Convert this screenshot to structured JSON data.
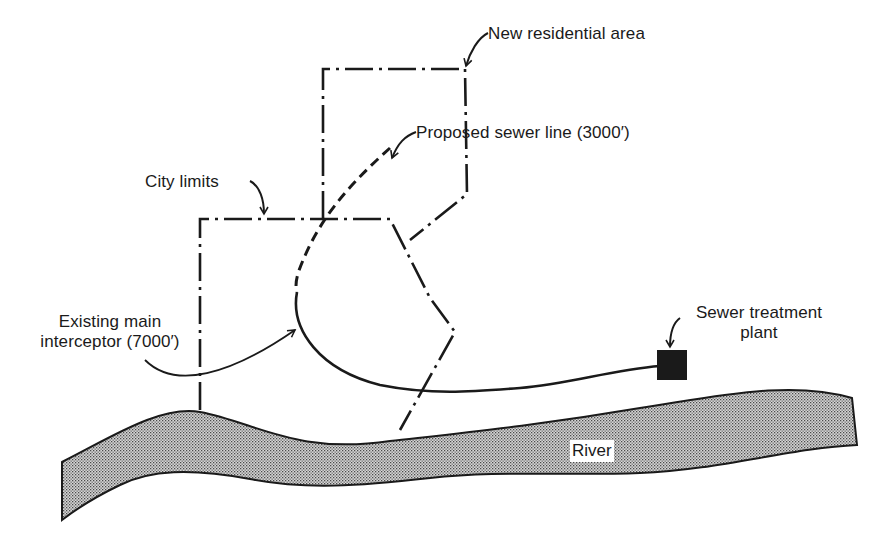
{
  "diagram": {
    "type": "site-plan schematic",
    "labels": {
      "new_residential_area": "New residential area",
      "proposed_sewer_line": "Proposed sewer line (3000′)",
      "city_limits": "City limits",
      "existing_main_interceptor_line1": "Existing main",
      "existing_main_interceptor_line2": "interceptor (7000′)",
      "sewer_treatment_plant_line1": "Sewer treatment",
      "sewer_treatment_plant_line2": "plant",
      "river": "River"
    },
    "legend_line_styles": {
      "city_limits": "dash-dot",
      "new_residential_area_boundary": "dash-dot",
      "proposed_sewer_line": "dashed",
      "existing_main_interceptor": "solid"
    },
    "quantities": {
      "proposed_sewer_line_length_ft": 3000,
      "existing_main_interceptor_length_ft": 7000
    },
    "colors": {
      "ink": "#1a1a1a",
      "river_fill": "#bdbdbd",
      "background": "#ffffff"
    }
  }
}
